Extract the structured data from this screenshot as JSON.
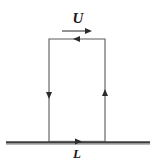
{
  "figure": {
    "canvas": {
      "width": 157,
      "height": 160,
      "background": "#ffffff"
    },
    "labels": {
      "velocity": "U",
      "length": "L"
    },
    "colors": {
      "contour": "#5a5a5a",
      "ground": "#3d3d3d",
      "arrowhead": "#2b2b2b",
      "text": "#1a1a1a",
      "background": "#ffffff"
    },
    "geometry": {
      "rect_left": 49,
      "rect_right": 105,
      "rect_top": 39,
      "rect_bottom": 142,
      "ground_y": 142,
      "ground_left": 6,
      "ground_right": 150
    },
    "annotations": [
      {
        "name": "free-stream-arrow",
        "direction": "right",
        "label": "U",
        "x1": 62,
        "x2": 92,
        "y": 31
      },
      {
        "name": "contour-arrow-top",
        "direction": "left",
        "x": 77,
        "y": 39
      },
      {
        "name": "contour-arrow-left",
        "direction": "down",
        "x": 49,
        "y": 94
      },
      {
        "name": "contour-arrow-right",
        "direction": "up",
        "x": 105,
        "y": 94
      },
      {
        "name": "contour-arrow-bottom",
        "direction": "right",
        "x": 77,
        "y": 142
      }
    ]
  }
}
